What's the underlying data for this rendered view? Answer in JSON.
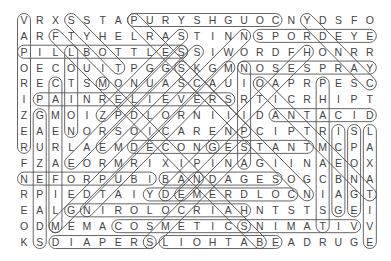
{
  "puzzle": {
    "rows": [
      "VRXSSTAPURYSHGUOCNYDSFO",
      "ARFTYHELRASTINNSPORDEYE",
      "PILLBOTTLESSIWORDFHONRR",
      "OECOUITPGGSKGMNOSESPRAY",
      "RECTSMONUASCAUIOAPRPESC",
      "IPAINRELIEVERSRTICRHIPT",
      "ZGMOIZPDLORNIIIDANTACID",
      "EAENORSOICARENPCIPTRISL",
      "RURLAEMDECONGESTANTMCPA",
      "FZAEORMRIXIPINAGIINAEOX",
      "NEFORPUBIBANDAGESOGCBNA",
      "RPIEDTAIYDEMERDLOCNIAGT",
      "EALGNIROLOCRIAHNTSTSGEI",
      "ODMEMACOSMETICSNIMATIVV",
      "KSDIAPERSLIOHTABEADRUGE"
    ],
    "found_words": [
      {
        "word": "COUGH SYRUP",
        "from": [
          1,
          8
        ],
        "to": [
          1,
          17
        ]
      },
      {
        "word": "EYE DROPS",
        "from": [
          2,
          16
        ],
        "to": [
          2,
          23
        ]
      },
      {
        "word": "PILL BOTTLES",
        "from": [
          3,
          1
        ],
        "to": [
          3,
          11
        ]
      },
      {
        "word": "NOSE SPRAY",
        "from": [
          4,
          15
        ],
        "to": [
          4,
          23
        ]
      },
      {
        "word": "PAIN RELIEVERS",
        "from": [
          6,
          2
        ],
        "to": [
          6,
          14
        ]
      },
      {
        "word": "ANTACID",
        "from": [
          7,
          17
        ],
        "to": [
          7,
          23
        ]
      },
      {
        "word": "DECONGESTANT",
        "from": [
          9,
          8
        ],
        "to": [
          9,
          19
        ]
      },
      {
        "word": "IBUPROFEN",
        "from": [
          11,
          1
        ],
        "to": [
          11,
          9
        ]
      },
      {
        "word": "BANDAGES",
        "from": [
          11,
          10
        ],
        "to": [
          11,
          17
        ]
      },
      {
        "word": "COLD REMEDY",
        "from": [
          12,
          9
        ],
        "to": [
          12,
          18
        ]
      },
      {
        "word": "HAIR COLORING",
        "from": [
          13,
          4
        ],
        "to": [
          13,
          15
        ]
      },
      {
        "word": "COSMETICS",
        "from": [
          14,
          7
        ],
        "to": [
          14,
          15
        ]
      },
      {
        "word": "VITAMINS",
        "from": [
          14,
          15
        ],
        "to": [
          14,
          22
        ]
      },
      {
        "word": "DIAPERS",
        "from": [
          15,
          3
        ],
        "to": [
          15,
          9
        ]
      },
      {
        "word": "BATH OILS",
        "from": [
          15,
          10
        ],
        "to": [
          15,
          17
        ]
      },
      {
        "word": "VAPORIZER",
        "from": [
          1,
          1
        ],
        "to": [
          9,
          1
        ]
      },
      {
        "word": "GAUZE PADS",
        "from": [
          7,
          2
        ],
        "to": [
          15,
          2
        ]
      },
      {
        "word": "CAMERA FILM",
        "from": [
          5,
          3
        ],
        "to": [
          14,
          3
        ]
      },
      {
        "word": "LOTION",
        "from": [
          3,
          4
        ],
        "to": [
          8,
          4
        ]
      },
      {
        "word": "ASPIRIN",
        "from": [
          4,
          15
        ],
        "to": [
          10,
          15
        ]
      },
      {
        "word": "PHARMACIST",
        "from": [
          5,
          20
        ],
        "to": [
          14,
          20
        ]
      },
      {
        "word": "ICE BAG",
        "from": [
          8,
          21
        ],
        "to": [
          13,
          21
        ]
      },
      {
        "word": "SPONGE",
        "from": [
          8,
          22
        ],
        "to": [
          13,
          22
        ]
      },
      {
        "word": "LAXATIVE",
        "from": [
          8,
          23
        ],
        "to": [
          15,
          23
        ]
      },
      {
        "word": "TOYS",
        "from": [
          1,
          4
        ],
        "to": [
          4,
          7
        ]
      },
      {
        "word": "FLU",
        "from": [
          2,
          3
        ],
        "to": [
          5,
          6
        ]
      },
      {
        "word": "DIAG-1",
        "from": [
          1,
          19
        ],
        "to": [
          5,
          23
        ]
      },
      {
        "word": "DIAG-2",
        "from": [
          3,
          19
        ],
        "to": [
          9,
          13
        ]
      },
      {
        "word": "DIAG-3",
        "from": [
          2,
          11
        ],
        "to": [
          7,
          6
        ]
      },
      {
        "word": "DIAG-4",
        "from": [
          3,
          11
        ],
        "to": [
          10,
          4
        ]
      },
      {
        "word": "DIAG-5",
        "from": [
          2,
          15
        ],
        "to": [
          14,
          3
        ]
      },
      {
        "word": "DIAG-6",
        "from": [
          4,
          14
        ],
        "to": [
          13,
          5
        ]
      },
      {
        "word": "DIAG-7",
        "from": [
          3,
          12
        ],
        "to": [
          9,
          6
        ]
      },
      {
        "word": "DIAG-8",
        "from": [
          5,
          6
        ],
        "to": [
          15,
          16
        ]
      },
      {
        "word": "DIAG-9",
        "from": [
          4,
          11
        ],
        "to": [
          12,
          19
        ]
      },
      {
        "word": "DIAG-10",
        "from": [
          1,
          8
        ],
        "to": [
          8,
          15
        ]
      },
      {
        "word": "DIAG-11",
        "from": [
          5,
          16
        ],
        "to": [
          12,
          23
        ]
      },
      {
        "word": "DIAG-12",
        "from": [
          9,
          15
        ],
        "to": [
          15,
          9
        ]
      },
      {
        "word": "DIAG-13",
        "from": [
          11,
          12
        ],
        "to": [
          12,
          11
        ]
      },
      {
        "word": "DIAG-14",
        "from": [
          12,
          10
        ],
        "to": [
          9,
          13
        ]
      }
    ]
  },
  "colors": {
    "text": "#444444",
    "outline": "#555555",
    "background": "#ffffff"
  },
  "layout": {
    "origin_x": 24,
    "origin_y": 20,
    "col_step": 15.72,
    "row_step": 15.86,
    "capsule_radius": 6.5
  }
}
